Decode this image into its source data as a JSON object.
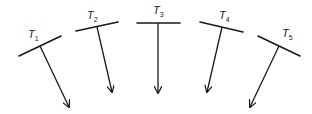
{
  "diagram": {
    "stroke_color": "#1a1a1a",
    "items": [
      {
        "id": "T1",
        "label": "T",
        "subscript": "1",
        "bar": [
          19,
          56,
          61,
          36
        ],
        "stem": [
          40,
          46,
          69,
          107
        ],
        "label_pos": [
          28,
          38
        ]
      },
      {
        "id": "T2",
        "label": "T",
        "subscript": "2",
        "bar": [
          76,
          31,
          118,
          22
        ],
        "stem": [
          97,
          27,
          112,
          92
        ],
        "label_pos": [
          87,
          19
        ]
      },
      {
        "id": "T3",
        "label": "T",
        "subscript": "3",
        "bar": [
          137,
          23,
          180,
          23
        ],
        "stem": [
          158,
          23,
          158,
          93
        ],
        "label_pos": [
          153,
          14
        ]
      },
      {
        "id": "T4",
        "label": "T",
        "subscript": "4",
        "bar": [
          200,
          22,
          243,
          32
        ],
        "stem": [
          222,
          27,
          207,
          92
        ],
        "label_pos": [
          219,
          19
        ]
      },
      {
        "id": "T5",
        "label": "T",
        "subscript": "5",
        "bar": [
          258,
          36,
          300,
          56
        ],
        "stem": [
          279,
          46,
          250,
          107
        ],
        "label_pos": [
          282,
          37
        ]
      }
    ]
  }
}
